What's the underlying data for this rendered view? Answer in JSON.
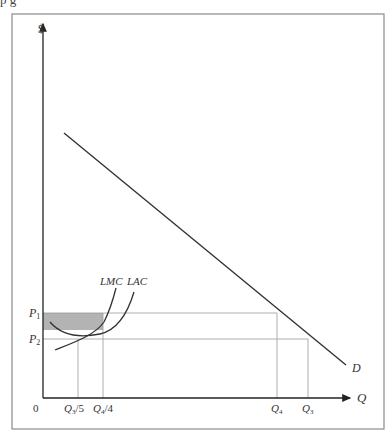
{
  "top_fragment": "p                 g",
  "diagram": {
    "y_axis_label": "$",
    "x_axis_label": "Q",
    "origin_label": "0",
    "price_labels": {
      "p1": "P",
      "p1_sub": "1",
      "p2": "P",
      "p2_sub": "2"
    },
    "quantity_labels": {
      "q3_5": "Q",
      "q3_5_sub": "3",
      "q3_5_suffix": "/5",
      "q4_4": "Q",
      "q4_4_sub": "4",
      "q4_4_suffix": "/4",
      "q4": "Q",
      "q4_sub": "4",
      "q3": "Q",
      "q3_sub": "3"
    },
    "curve_labels": {
      "lmc": "LMC",
      "lac": "LAC",
      "demand": "D"
    },
    "colors": {
      "shade": "#b3b3b3",
      "line": "#333333",
      "guide": "#9a9a9a",
      "frame": "#8a8a8a"
    }
  }
}
